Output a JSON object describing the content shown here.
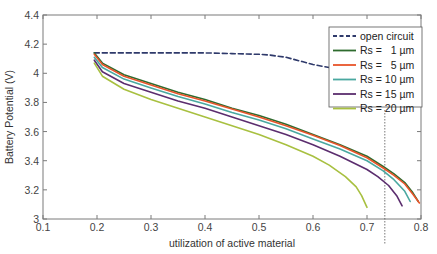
{
  "chart_data": {
    "type": "line",
    "title": "",
    "xlabel": "utilization of active material",
    "ylabel": "Battery Potential (V)",
    "xlim": [
      0.1,
      0.8
    ],
    "ylim": [
      3.0,
      4.4
    ],
    "xticks": [
      "0.1",
      "0.2",
      "0.3",
      "0.4",
      "0.5",
      "0.6",
      "0.7",
      "0.8"
    ],
    "yticks": [
      "3",
      "3.2",
      "3.4",
      "3.6",
      "3.8",
      "4",
      "4.2",
      "4.4"
    ],
    "grid": false,
    "legend_position": "upper right",
    "annotations": [
      {
        "type": "vertical-dotted-line",
        "x": 0.733
      }
    ],
    "series": [
      {
        "name": "open circuit",
        "style": "dashed",
        "color": "#2f3a6b",
        "x": [
          0.195,
          0.25,
          0.3,
          0.35,
          0.4,
          0.45,
          0.5,
          0.52,
          0.55,
          0.58,
          0.6,
          0.63,
          0.65,
          0.68,
          0.7,
          0.72,
          0.73
        ],
        "y": [
          4.14,
          4.14,
          4.14,
          4.14,
          4.14,
          4.135,
          4.13,
          4.125,
          4.11,
          4.08,
          4.06,
          4.04,
          4.025,
          4.01,
          4.0,
          3.99,
          3.98
        ]
      },
      {
        "name": "Rs =   1 µm",
        "style": "solid",
        "color": "#2e6b2e",
        "x": [
          0.195,
          0.21,
          0.25,
          0.3,
          0.35,
          0.4,
          0.45,
          0.5,
          0.55,
          0.6,
          0.65,
          0.7,
          0.73,
          0.75,
          0.77,
          0.785,
          0.795
        ],
        "y": [
          4.14,
          4.07,
          3.99,
          3.93,
          3.87,
          3.82,
          3.76,
          3.71,
          3.65,
          3.58,
          3.51,
          3.43,
          3.36,
          3.31,
          3.25,
          3.18,
          3.12
        ]
      },
      {
        "name": "Rs =   5 µm",
        "style": "solid",
        "color": "#e8542a",
        "x": [
          0.195,
          0.21,
          0.25,
          0.3,
          0.35,
          0.4,
          0.45,
          0.5,
          0.55,
          0.6,
          0.65,
          0.7,
          0.73,
          0.75,
          0.77,
          0.785,
          0.797
        ],
        "y": [
          4.13,
          4.06,
          3.98,
          3.92,
          3.86,
          3.81,
          3.755,
          3.7,
          3.64,
          3.575,
          3.505,
          3.42,
          3.35,
          3.3,
          3.24,
          3.17,
          3.11
        ]
      },
      {
        "name": "Rs = 10 µm",
        "style": "solid",
        "color": "#4aa8a0",
        "x": [
          0.195,
          0.21,
          0.25,
          0.3,
          0.35,
          0.4,
          0.45,
          0.5,
          0.55,
          0.6,
          0.65,
          0.7,
          0.73,
          0.75,
          0.77,
          0.78
        ],
        "y": [
          4.11,
          4.04,
          3.96,
          3.9,
          3.84,
          3.79,
          3.73,
          3.68,
          3.62,
          3.55,
          3.48,
          3.4,
          3.33,
          3.27,
          3.19,
          3.12
        ]
      },
      {
        "name": "Rs = 15 µm",
        "style": "solid",
        "color": "#5b2d6e",
        "x": [
          0.195,
          0.21,
          0.25,
          0.3,
          0.35,
          0.4,
          0.45,
          0.5,
          0.55,
          0.6,
          0.65,
          0.7,
          0.72,
          0.74,
          0.755,
          0.765
        ],
        "y": [
          4.09,
          4.01,
          3.93,
          3.87,
          3.81,
          3.76,
          3.7,
          3.64,
          3.58,
          3.51,
          3.43,
          3.34,
          3.29,
          3.23,
          3.16,
          3.09
        ]
      },
      {
        "name": "Rs = 20 µm",
        "style": "solid",
        "color": "#a8c040",
        "x": [
          0.195,
          0.21,
          0.25,
          0.3,
          0.35,
          0.4,
          0.45,
          0.5,
          0.55,
          0.6,
          0.63,
          0.66,
          0.68,
          0.69,
          0.7
        ],
        "y": [
          4.07,
          3.98,
          3.89,
          3.82,
          3.76,
          3.7,
          3.64,
          3.58,
          3.51,
          3.43,
          3.37,
          3.29,
          3.22,
          3.16,
          3.08
        ]
      }
    ]
  }
}
